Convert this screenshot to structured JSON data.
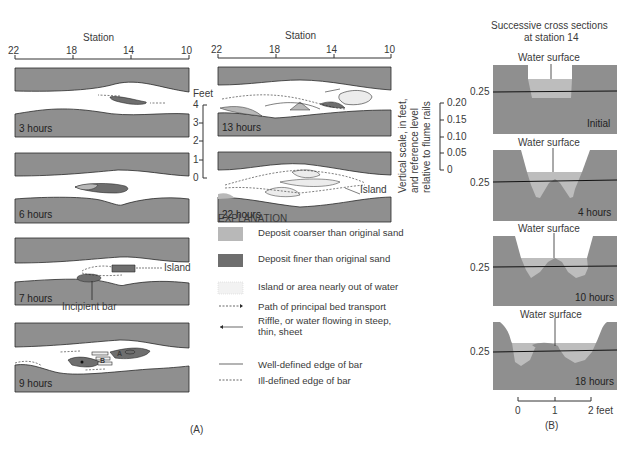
{
  "panel_a": {
    "caption": "(A)",
    "station_label_left": "Station",
    "station_label_right": "Station",
    "station_ticks": [
      "22",
      "18",
      "14",
      "10"
    ],
    "feet_scale": {
      "title": "Feet",
      "ticks": [
        "4",
        "3",
        "2",
        "1",
        "0"
      ]
    },
    "vertical_scale": {
      "label_line1": "Vertical scale, in feet,",
      "label_line2": "and reference level",
      "label_line3": "relative to flume rails",
      "ticks": [
        "0.20",
        "0.15",
        "0.10",
        "0.05",
        "0"
      ]
    },
    "panels": [
      {
        "time": "3 hours"
      },
      {
        "time": "6 hours"
      },
      {
        "time": "7 hours",
        "callouts": [
          "Island",
          "Incipient bar"
        ]
      },
      {
        "time": "9 hours",
        "bar_labels": [
          "A",
          "B"
        ]
      },
      {
        "time": "13 hours"
      },
      {
        "time": "22 hours",
        "callouts": [
          "Island"
        ]
      }
    ],
    "explanation": {
      "title": "EXPLANATION",
      "items": [
        {
          "symbol": "coarse-deposit-swatch",
          "label": "Deposit coarser than original sand"
        },
        {
          "symbol": "fine-deposit-swatch",
          "label": "Deposit finer than original sand"
        },
        {
          "symbol": "island-stipple-swatch",
          "label": "Island or area nearly out of water"
        },
        {
          "symbol": "dashed-arrow",
          "label": "Path of principal bed transport"
        },
        {
          "symbol": "solid-arrow",
          "label": "Riffle, or water flowing in steep, thin, sheet"
        },
        {
          "symbol": "solid-line",
          "label": "Well-defined edge of bar"
        },
        {
          "symbol": "dashed-line",
          "label": "Ill-defined edge of bar"
        }
      ]
    }
  },
  "panel_b": {
    "title_line1": "Successive cross sections",
    "title_line2": "at station 14",
    "caption": "(B)",
    "sections": [
      {
        "water_label": "Water surface",
        "level_label": "0.25",
        "time": "Initial"
      },
      {
        "water_label": "Water surface",
        "level_label": "0.25",
        "time": "4 hours"
      },
      {
        "water_label": "Water surface",
        "level_label": "0.25",
        "time": "10 hours"
      },
      {
        "water_label": "Water surface",
        "level_label": "0.25",
        "time": "18 hours"
      }
    ],
    "horizontal_scale": {
      "ticks": [
        "0",
        "1",
        "2 feet"
      ]
    }
  },
  "colors": {
    "bank_gray": "#8f8f8f",
    "coarse_deposit": "#b8b8b8",
    "fine_deposit": "#6e6e6e",
    "line": "#2a2a2a"
  }
}
